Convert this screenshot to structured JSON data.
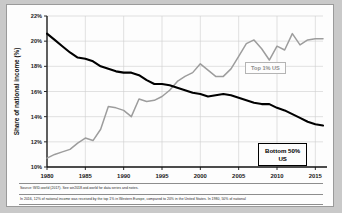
{
  "figure": {
    "background": "#fdfdfd",
    "border_color": "#9a9a9a",
    "source_note": "Source: WID.world (2017). See wir2018.wid.world for data series and notes.",
    "caption_note": "In 2016, 12% of national income was received by the top 1% in Western Europe, compared to 20% in the United States. In 1980, 50% of national"
  },
  "labels": {
    "top_series_label": "Top 1% US",
    "bottom_series_label": "Bottom 50%\nUS"
  },
  "chart_data": {
    "type": "line",
    "title": "",
    "xlabel": "",
    "ylabel": "Share of national income (%)",
    "xlim": [
      1980,
      2016
    ],
    "ylim": [
      10,
      22
    ],
    "grid": true,
    "legend_position": "inline-annotations",
    "xticks": [
      1980,
      1985,
      1990,
      1995,
      2000,
      2005,
      2010,
      2015
    ],
    "xticklabels": [
      "1980",
      "1985",
      "1990",
      "1995",
      "2000",
      "2005",
      "2010",
      "2015"
    ],
    "yticks": [
      10,
      12,
      14,
      16,
      18,
      20,
      22
    ],
    "yticklabels": [
      "10%",
      "12%",
      "14%",
      "16%",
      "18%",
      "20%",
      "22%"
    ],
    "x": [
      1980,
      1981,
      1982,
      1983,
      1984,
      1985,
      1986,
      1987,
      1988,
      1989,
      1990,
      1991,
      1992,
      1993,
      1994,
      1995,
      1996,
      1997,
      1998,
      1999,
      2000,
      2001,
      2002,
      2003,
      2004,
      2005,
      2006,
      2007,
      2008,
      2009,
      2010,
      2011,
      2012,
      2013,
      2014,
      2015,
      2016
    ],
    "series": [
      {
        "name": "Bottom 50% US",
        "color": "#000000",
        "values": [
          20.6,
          20.1,
          19.6,
          19.1,
          18.7,
          18.6,
          18.4,
          18.0,
          17.8,
          17.6,
          17.5,
          17.5,
          17.3,
          16.9,
          16.6,
          16.6,
          16.5,
          16.3,
          16.1,
          15.9,
          15.8,
          15.6,
          15.7,
          15.8,
          15.7,
          15.5,
          15.3,
          15.1,
          15.0,
          15.0,
          14.7,
          14.5,
          14.2,
          13.9,
          13.6,
          13.4,
          13.3
        ]
      },
      {
        "name": "Top 1% US",
        "color": "#9d9d9d",
        "values": [
          10.7,
          11.0,
          11.2,
          11.4,
          11.9,
          12.3,
          12.1,
          13.0,
          14.8,
          14.7,
          14.5,
          14.0,
          15.4,
          15.2,
          15.3,
          15.6,
          16.1,
          16.8,
          17.2,
          17.5,
          18.2,
          17.7,
          17.2,
          17.2,
          17.8,
          18.8,
          19.8,
          20.1,
          19.4,
          18.5,
          19.6,
          19.3,
          20.6,
          19.7,
          20.1,
          20.2,
          20.2
        ]
      }
    ]
  },
  "geometry": {
    "plot_left": 40,
    "plot_right": 316,
    "plot_top": 11,
    "plot_bottom": 162
  }
}
